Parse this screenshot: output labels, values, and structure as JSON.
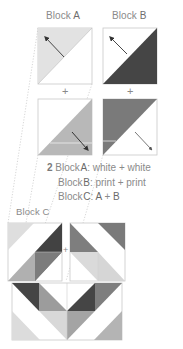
{
  "headers": {
    "block_a": {
      "word": "Block",
      "letter": "A"
    },
    "block_b": {
      "word": "Block",
      "letter": "B"
    },
    "block_c": {
      "word": "Block",
      "letter": "C"
    }
  },
  "plus_sign": "+",
  "step": {
    "number": "2",
    "lines": [
      {
        "word": "Block",
        "letter": "A",
        "rest": ": white + white"
      },
      {
        "word": "Block",
        "letter": "B",
        "rest": ": print + print"
      },
      {
        "word": "Block",
        "letter": "C",
        "rest_a": ": ",
        "a": "A",
        "plus": " + ",
        "b": "B"
      }
    ]
  },
  "colors": {
    "light_print": "#dcdcdc",
    "medium_print": "#b4b4b4",
    "mid_gray": "#8e8e8e",
    "dark_print": "#4a4a4a",
    "darker_gray": "#787878",
    "outline": "#c8c8c8",
    "arrow": "#3a3a3a",
    "guide": "#c4c4c4"
  },
  "icons": {
    "arrow_up_left": "arrow-up-left",
    "arrow_down_right": "arrow-down-right"
  }
}
